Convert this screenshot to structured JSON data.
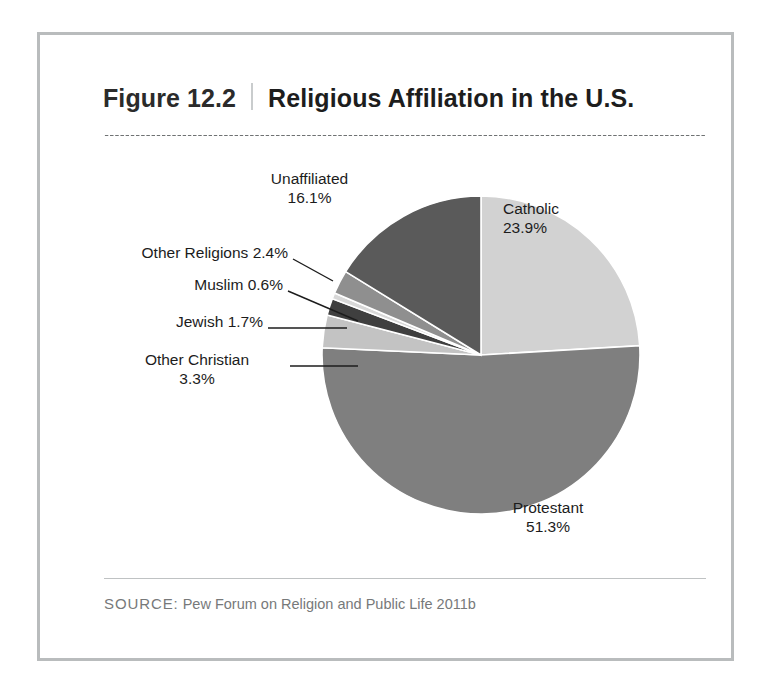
{
  "figure": {
    "number": "Figure 12.2",
    "title": "Religious Affiliation in the U.S.",
    "source_word": "SOURCE:",
    "source_text": " Pew Forum on Religion and Public Life 2011b"
  },
  "chart_data": {
    "type": "pie",
    "title": "Religious Affiliation in the U.S.",
    "xlabel": "",
    "ylabel": "",
    "units": "percent",
    "legend_position": "none",
    "grid": false,
    "start_angle_deg": 0,
    "direction": "clockwise",
    "categories": [
      "Catholic",
      "Protestant",
      "Other Christian",
      "Jewish",
      "Muslim",
      "Other Religions",
      "Unaffiliated"
    ],
    "values": [
      23.9,
      51.3,
      3.3,
      1.7,
      0.6,
      2.4,
      16.1
    ],
    "colors": [
      "#d2d2d2",
      "#7f7f7f",
      "#c3c3c3",
      "#3f3f3f",
      "#d8d8d8",
      "#8f8f8f",
      "#5a5a5a"
    ],
    "slices": [
      {
        "name": "Catholic",
        "value": 23.9,
        "color": "#d2d2d2",
        "label_lines": [
          "Catholic",
          "23.9%"
        ],
        "label_align": "left",
        "leader": false
      },
      {
        "name": "Protestant",
        "value": 51.3,
        "color": "#7f7f7f",
        "label_lines": [
          "Protestant",
          "51.3%"
        ],
        "label_align": "center",
        "leader": false
      },
      {
        "name": "Other Christian",
        "value": 3.3,
        "color": "#c3c3c3",
        "label_lines": [
          "Other Christian",
          "3.3%"
        ],
        "label_align": "center",
        "leader": true
      },
      {
        "name": "Jewish",
        "value": 1.7,
        "color": "#3f3f3f",
        "label_lines": [
          "Jewish 1.7%"
        ],
        "label_align": "right",
        "leader": true
      },
      {
        "name": "Muslim",
        "value": 0.6,
        "color": "#d8d8d8",
        "label_lines": [
          "Muslim 0.6%"
        ],
        "label_align": "right",
        "leader": true
      },
      {
        "name": "Other Religions",
        "value": 2.4,
        "color": "#8f8f8f",
        "label_lines": [
          "Other Religions 2.4%"
        ],
        "label_align": "right",
        "leader": true
      },
      {
        "name": "Unaffiliated",
        "value": 16.1,
        "color": "#5a5a5a",
        "label_lines": [
          "Unaffiliated",
          "16.1%"
        ],
        "label_align": "center",
        "leader": false
      }
    ]
  },
  "labels": {
    "catholic": {
      "line1": "Catholic",
      "line2": "23.9%"
    },
    "protestant": {
      "line1": "Protestant",
      "line2": "51.3%"
    },
    "unaffiliated": {
      "line1": "Unaffiliated",
      "line2": "16.1%"
    },
    "other_religions": {
      "line1": "Other Religions 2.4%"
    },
    "muslim": {
      "line1": "Muslim 0.6%"
    },
    "jewish": {
      "line1": "Jewish 1.7%"
    },
    "other_christian": {
      "line1": "Other Christian",
      "line2": "3.3%"
    }
  },
  "colors": {
    "frame_border": "#b9bcbd",
    "title_text": "#1d1d1d",
    "source_text": "#77797a",
    "rule": "#bfc2c3"
  }
}
